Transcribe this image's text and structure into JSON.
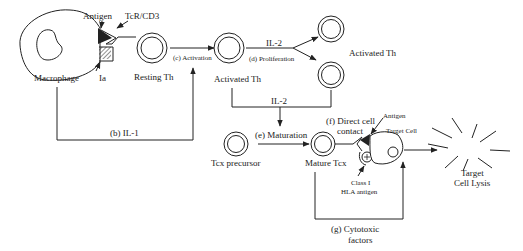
{
  "diagram": {
    "colors": {
      "ink": "#222222",
      "background": "#ffffff"
    },
    "nodes": {
      "macrophage": "Macrophage",
      "antigen_top": "Antigen",
      "tcr": "TcR/CD3",
      "ia": "Ia",
      "resting_th": "Resting Th",
      "activated_th_mid": "Activated Th",
      "activated_th_right": "Activated Th",
      "tcx_precursor": "Tcx precursor",
      "mature_tcx": "Mature Tcx",
      "antigen_bottom": "Antigen",
      "target_cell": "Target Cell",
      "class1_line1": "Class I",
      "class1_line2": "HLA antigen",
      "lysis_line1": "Target",
      "lysis_line2": "Cell Lysis"
    },
    "edges": {
      "b": "(b) IL-1",
      "c": "(c) Activation",
      "il2_top": "IL-2",
      "d": "(d) Proliferation",
      "il2_mid": "IL-2",
      "e": "(e) Maturation",
      "f_line1": "(f) Direct cell",
      "f_line2": "contact",
      "g_line1": "(g) Cytotoxic",
      "g_line2": "factors"
    }
  }
}
